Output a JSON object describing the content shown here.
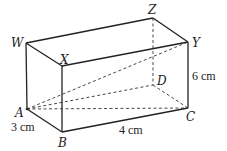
{
  "figure": {
    "type": "cuboid",
    "vertices": {
      "W": "W",
      "X": "X",
      "Y": "Y",
      "Z": "Z",
      "A": "A",
      "B": "B",
      "C": "C",
      "D": "D"
    },
    "dimensions": {
      "AB": "3 cm",
      "BC": "4 cm",
      "CY": "6 cm"
    },
    "dashed_lines": [
      "ZD",
      "AD",
      "DC",
      "AC",
      "AY"
    ]
  }
}
